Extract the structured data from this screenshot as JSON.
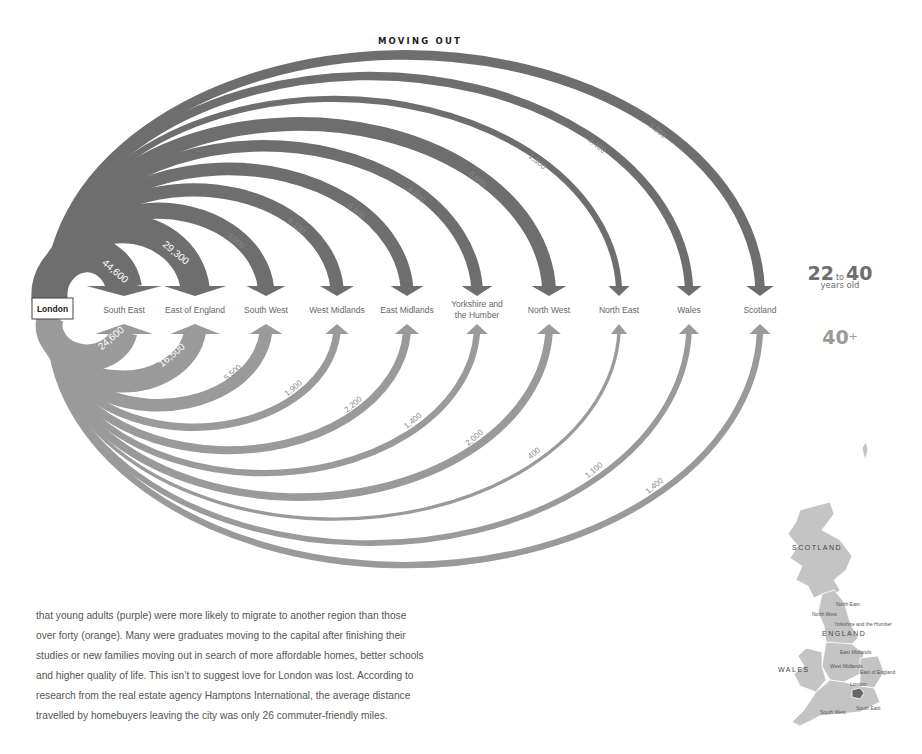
{
  "title": "MOVING OUT",
  "legend": {
    "young_from": "22",
    "young_to_word": "to",
    "young_to": "40",
    "young_sub": "years old",
    "old": "40",
    "old_suffix": "+",
    "young_color": "#6e6e6e",
    "old_color": "#9a9a9a"
  },
  "origin": "London",
  "body_text": [
    "that young adults (purple) were more likely to migrate to another region than those",
    "over forty (orange). Many were graduates moving to the capital after finishing their",
    "studies or new families moving out in search of more affordable homes, better schools",
    "and higher quality of life. This isn’t to suggest love for London was lost. According to",
    "research from the real estate agency Hamptons International, the average distance",
    "travelled by homebuyers leaving the city was only 26 commuter-friendly miles."
  ],
  "map": {
    "countries": [
      "SCOTLAND",
      "ENGLAND",
      "WALES"
    ],
    "regions": [
      "North East",
      "North West",
      "Yorkshire and the Humber",
      "East Midlands",
      "West Midlands",
      "East of England",
      "London",
      "South East",
      "South West"
    ]
  },
  "chart_data": {
    "type": "arc-flow",
    "title": "MOVING OUT",
    "origin": "London",
    "categories": [
      "South East",
      "East of England",
      "South West",
      "West Midlands",
      "East Midlands",
      "Yorkshire and the Humber",
      "North West",
      "North East",
      "Wales",
      "Scotland"
    ],
    "series": [
      {
        "name": "22 to 40 years old",
        "values": [
          44600,
          29300,
          9000,
          6100,
          5600,
          4600,
          6500,
          1300,
          2400,
          3200
        ],
        "labels": [
          "44,600",
          "29,300",
          "9,000",
          "6,100",
          "5,600",
          "4,600",
          "6,500",
          "1,300",
          "2,400",
          "3,200"
        ]
      },
      {
        "name": "40+",
        "values": [
          24600,
          16500,
          5500,
          1900,
          2200,
          1400,
          2000,
          400,
          1100,
          1400
        ],
        "labels": [
          "24,600",
          "16,500",
          "5,500",
          "1,900",
          "2,200",
          "1,400",
          "2,000",
          "400",
          "1,100",
          "1,400"
        ]
      }
    ],
    "legend_position": "right",
    "grid": false
  }
}
